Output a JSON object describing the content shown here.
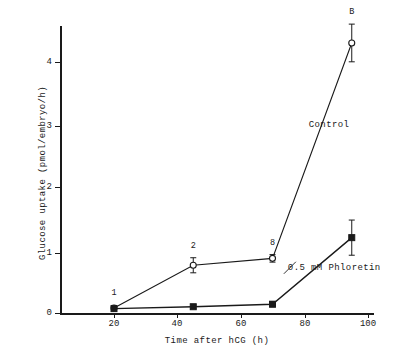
{
  "chart_data": {
    "type": "line",
    "title": "",
    "xlabel": "Time after hCG  (h)",
    "ylabel": "Glucose uptake  (pmol/embryo/h)",
    "xlim": [
      10,
      110
    ],
    "ylim": [
      0,
      4.75
    ],
    "xticks": [
      20,
      40,
      60,
      80,
      100
    ],
    "yticks": [
      0,
      1,
      2,
      3,
      4
    ],
    "grid": false,
    "legend_position": "inline-annotation",
    "series": [
      {
        "name": "Control",
        "marker": "open-circle",
        "x": [
          20,
          45,
          70,
          95
        ],
        "values": [
          0.08,
          0.76,
          0.87,
          4.3
        ],
        "errors": [
          0.04,
          0.12,
          0.06,
          0.3
        ],
        "point_labels": [
          "1",
          "2",
          "8",
          "B"
        ]
      },
      {
        "name": "0.5 mM Phloretin",
        "marker": "filled-square",
        "x": [
          20,
          45,
          70,
          95
        ],
        "values": [
          0.07,
          0.1,
          0.14,
          1.2
        ],
        "errors": [
          0.03,
          0.03,
          0.04,
          0.28
        ],
        "point_labels": [
          "",
          "",
          "",
          ""
        ]
      }
    ],
    "annotations": [
      {
        "text": "Control",
        "x": 95,
        "y": 3.0
      },
      {
        "text": "0.5 mM Phloretin",
        "x": 78,
        "y": 0.72
      }
    ]
  },
  "axes": {
    "y_title": "Glucose uptake  (pmol/embryo/h)",
    "x_title": "Time after hCG  (h)",
    "y_tick_labels": [
      "0",
      "1",
      "2",
      "3",
      "4"
    ],
    "x_tick_labels": [
      "20",
      "40",
      "60",
      "80",
      "100"
    ]
  },
  "labels": {
    "control": "Control",
    "phloretin": "0.5 mM Phloretin",
    "pt1": "1",
    "pt2": "2",
    "pt3": "8",
    "pt4": "B"
  },
  "colors": {
    "ink": "#1a1a1a",
    "background": "#ffffff"
  }
}
